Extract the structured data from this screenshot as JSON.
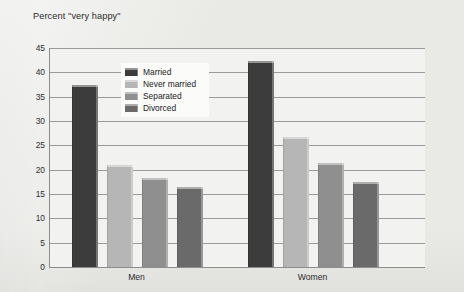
{
  "chart_data": {
    "type": "bar",
    "title": "Percent \"very happy\"",
    "xlabel": "",
    "ylabel": "",
    "categories": [
      "Men",
      "Women"
    ],
    "series": [
      {
        "name": "Married",
        "values": [
          37.3,
          42.3
        ],
        "color": "#3c3c3c"
      },
      {
        "name": "Never married",
        "values": [
          20.9,
          26.8
        ],
        "color": "#b6b6b6"
      },
      {
        "name": "Separated",
        "values": [
          18.3,
          21.3
        ],
        "color": "#8f8f8f"
      },
      {
        "name": "Divorced",
        "values": [
          16.5,
          17.5
        ],
        "color": "#6a6a6a"
      }
    ],
    "ylim": [
      0,
      45
    ],
    "ytick_step": 5,
    "yticks": [
      "0",
      "5",
      "10",
      "15",
      "20",
      "25",
      "30",
      "35",
      "40",
      "45"
    ],
    "grid": true,
    "legend_position": "upper-left-inset",
    "background_color": "#e9e9e6",
    "plot_background_color": "#f2f2f0",
    "axis_color": "#8d8d8d",
    "gridline_color": "#9a9a9a"
  },
  "legend": {
    "items": [
      {
        "label": "Married"
      },
      {
        "label": "Never married"
      },
      {
        "label": "Separated"
      },
      {
        "label": "Divorced"
      }
    ]
  }
}
